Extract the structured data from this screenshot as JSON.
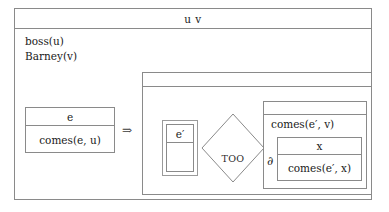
{
  "diagram": {
    "outer": {
      "title": "u v",
      "facts": [
        "boss(u)",
        "Barney(v)"
      ]
    },
    "antecedent": {
      "header": "e",
      "body": "comes(e, u)"
    },
    "implication_symbol": "⇒",
    "consequent": {
      "header": "",
      "event": {
        "header": "e′",
        "body": ""
      },
      "relation": {
        "label": "TOO"
      },
      "proposition": {
        "header": "",
        "text": "comes(e′, v)",
        "operator": "∂",
        "nested": {
          "header": "x",
          "body": "comes(e′, x)"
        }
      }
    }
  },
  "colors": {
    "background": "#ffffff",
    "border": "#8a8a8a",
    "text": "#1a1a1a"
  }
}
